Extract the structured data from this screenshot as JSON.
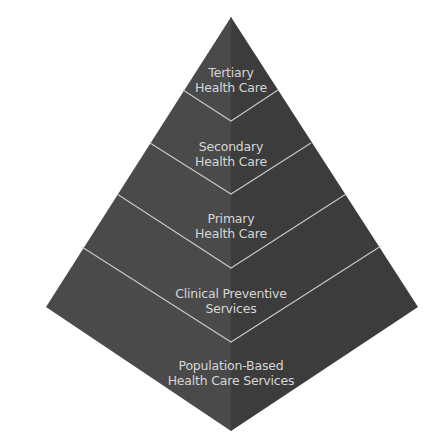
{
  "diagram": {
    "type": "pyramid",
    "colors": {
      "left_face": "#4a4a4a",
      "right_face": "#3c3c3c",
      "divider": "#c9c9c9",
      "label": "#d6d6d6",
      "background": "#ffffff"
    },
    "levels": [
      {
        "name": "tertiary",
        "label_line1": "Tertiary",
        "label_line2": "Health Care"
      },
      {
        "name": "secondary",
        "label_line1": "Secondary",
        "label_line2": "Health Care"
      },
      {
        "name": "primary",
        "label_line1": "Primary",
        "label_line2": "Health Care"
      },
      {
        "name": "clinical-preventive",
        "label_line1": "Clinical Preventive",
        "label_line2": "Services"
      },
      {
        "name": "population-based",
        "label_line1": "Population-Based",
        "label_line2": "Health Care Services"
      }
    ]
  }
}
